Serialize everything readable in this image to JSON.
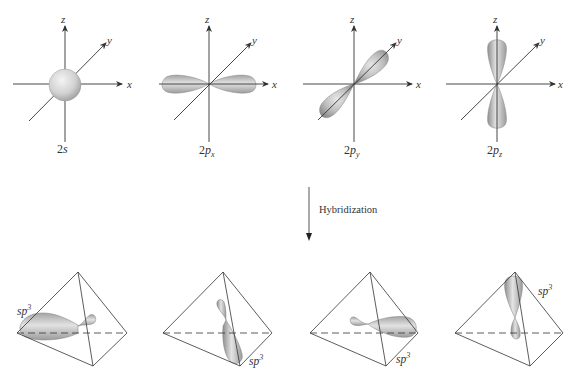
{
  "top_row": {
    "panels": [
      {
        "id": "2s",
        "caption_main": "2",
        "caption_letter": "s",
        "caption_sub": "",
        "shape": "sphere",
        "axes": {
          "x": "x",
          "y": "y",
          "z": "z"
        }
      },
      {
        "id": "2px",
        "caption_main": "2",
        "caption_letter": "p",
        "caption_sub": "x",
        "shape": "dumbbell-x",
        "axes": {
          "x": "x",
          "y": "y",
          "z": "z"
        }
      },
      {
        "id": "2py",
        "caption_main": "2",
        "caption_letter": "p",
        "caption_sub": "y",
        "shape": "dumbbell-y",
        "axes": {
          "x": "x",
          "y": "y",
          "z": "z"
        }
      },
      {
        "id": "2pz",
        "caption_main": "2",
        "caption_letter": "p",
        "caption_sub": "z",
        "shape": "dumbbell-z",
        "axes": {
          "x": "x",
          "y": "y",
          "z": "z"
        }
      }
    ]
  },
  "process": {
    "arrow_direction": "down",
    "label": "Hybridization"
  },
  "bottom_row": {
    "panels": [
      {
        "id": "sp3-1",
        "label_main": "sp",
        "label_sup": "3",
        "lobe_direction": "left"
      },
      {
        "id": "sp3-2",
        "label_main": "sp",
        "label_sup": "3",
        "lobe_direction": "front-bottom"
      },
      {
        "id": "sp3-3",
        "label_main": "sp",
        "label_sup": "3",
        "lobe_direction": "right"
      },
      {
        "id": "sp3-4",
        "label_main": "sp",
        "label_sup": "3",
        "lobe_direction": "top"
      }
    ]
  },
  "colors": {
    "line": "#333333",
    "orbital_light": "#e6e6e6",
    "orbital_dark": "#8a8a8a",
    "background": "#ffffff"
  }
}
